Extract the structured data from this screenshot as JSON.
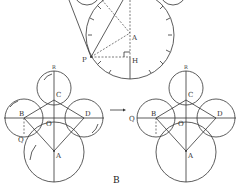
{
  "figure": {
    "caption": "B",
    "top_diagram": {
      "labels": {
        "A": "A",
        "P": "P",
        "H": "H"
      }
    },
    "left_diagram": {
      "labels": {
        "R": "R",
        "C": "C",
        "B": "B",
        "O": "O",
        "D": "D",
        "Q": "Q",
        "A": "A"
      }
    },
    "right_diagram": {
      "labels": {
        "R": "R",
        "C": "C",
        "B": "B",
        "O": "O",
        "D": "D",
        "Q": "Q",
        "A": "A"
      }
    },
    "transition_arrow": "→"
  }
}
